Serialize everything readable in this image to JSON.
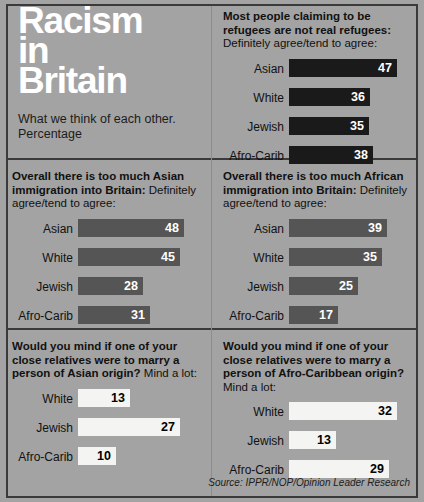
{
  "masthead": {
    "title_lines": [
      "Racism",
      "in",
      "Britain"
    ],
    "subtitle": "What we think of each other. Percentage"
  },
  "source": "Source: IPPR/NOP/Opinion Leader Research",
  "colors": {
    "background": "#a3a3a3",
    "frame": "#3a3a3a",
    "bar_dark": "#1a1a1a",
    "bar_gray": "#555555",
    "bar_white": "#f4f4f2",
    "shadow": "#1d1d1d",
    "title_text": "#ffffff",
    "body_text": "#111111"
  },
  "panels": [
    {
      "id": "refugees",
      "question": "Most people claiming to be refugees are not real refugees:",
      "subquestion": "Definitely agree/tend to agree:",
      "style": "dark",
      "bars": [
        {
          "label": "Asian",
          "value": "47",
          "px": 108
        },
        {
          "label": "White",
          "value": "36",
          "px": 81
        },
        {
          "label": "Jewish",
          "value": "35",
          "px": 80
        },
        {
          "label": "Afro-Carib",
          "value": "38",
          "px": 84
        }
      ]
    },
    {
      "id": "asian-immigration",
      "question": "Overall there is too much Asian immigration into Britain:",
      "subquestion": "Definitely agree/tend to agree:",
      "style": "gray",
      "bars": [
        {
          "label": "Asian",
          "value": "48",
          "px": 106
        },
        {
          "label": "White",
          "value": "45",
          "px": 102
        },
        {
          "label": "Jewish",
          "value": "28",
          "px": 65
        },
        {
          "label": "Afro-Carib",
          "value": "31",
          "px": 72
        }
      ]
    },
    {
      "id": "african-immigration",
      "question": "Overall there is too much African immigration into Britain:",
      "subquestion": "Definitely agree/tend to agree:",
      "style": "gray",
      "bars": [
        {
          "label": "Asian",
          "value": "39",
          "px": 98
        },
        {
          "label": "White",
          "value": "35",
          "px": 93
        },
        {
          "label": "Jewish",
          "value": "25",
          "px": 69
        },
        {
          "label": "Afro-Carib",
          "value": "17",
          "px": 49
        }
      ]
    },
    {
      "id": "marry-asian",
      "question": "Would you mind if one of your close relatives were to marry a person of Asian origin?",
      "subquestion": "Mind a lot:",
      "style": "white",
      "bars": [
        {
          "label": "White",
          "value": "13",
          "px": 52
        },
        {
          "label": "Jewish",
          "value": "27",
          "px": 102
        },
        {
          "label": "Afro-Carib",
          "value": "10",
          "px": 38
        }
      ]
    },
    {
      "id": "marry-afro-caribbean",
      "question": "Would you mind if one of your close relatives were to marry a person of Afro-Caribbean origin?",
      "subquestion": "Mind a lot:",
      "style": "white",
      "bars": [
        {
          "label": "White",
          "value": "32",
          "px": 108
        },
        {
          "label": "Jewish",
          "value": "13",
          "px": 47
        },
        {
          "label": "Afro-Carib",
          "value": "29",
          "px": 100
        }
      ]
    }
  ],
  "chart_data": [
    {
      "type": "bar",
      "title": "Most people claiming to be refugees are not real refugees: Definitely agree/tend to agree:",
      "categories": [
        "Asian",
        "White",
        "Jewish",
        "Afro-Carib"
      ],
      "values": [
        47,
        36,
        35,
        38
      ],
      "xlabel": "",
      "ylabel": "Percentage",
      "ylim": [
        0,
        50
      ],
      "orientation": "horizontal",
      "grid": false,
      "legend": "none"
    },
    {
      "type": "bar",
      "title": "Overall there is too much Asian immigration into Britain: Definitely agree/tend to agree:",
      "categories": [
        "Asian",
        "White",
        "Jewish",
        "Afro-Carib"
      ],
      "values": [
        48,
        45,
        28,
        31
      ],
      "xlabel": "",
      "ylabel": "Percentage",
      "ylim": [
        0,
        50
      ],
      "orientation": "horizontal",
      "grid": false,
      "legend": "none"
    },
    {
      "type": "bar",
      "title": "Overall there is too much African immigration into Britain: Definitely agree/tend to agree:",
      "categories": [
        "Asian",
        "White",
        "Jewish",
        "Afro-Carib"
      ],
      "values": [
        39,
        35,
        25,
        17
      ],
      "xlabel": "",
      "ylabel": "Percentage",
      "ylim": [
        0,
        50
      ],
      "orientation": "horizontal",
      "grid": false,
      "legend": "none"
    },
    {
      "type": "bar",
      "title": "Would you mind if one of your close relatives were to marry a person of Asian origin? Mind a lot:",
      "categories": [
        "White",
        "Jewish",
        "Afro-Carib"
      ],
      "values": [
        13,
        27,
        10
      ],
      "xlabel": "",
      "ylabel": "Percentage",
      "ylim": [
        0,
        30
      ],
      "orientation": "horizontal",
      "grid": false,
      "legend": "none"
    },
    {
      "type": "bar",
      "title": "Would you mind if one of your close relatives were to marry a person of Afro-Caribbean origin? Mind a lot:",
      "categories": [
        "White",
        "Jewish",
        "Afro-Carib"
      ],
      "values": [
        32,
        13,
        29
      ],
      "xlabel": "",
      "ylabel": "Percentage",
      "ylim": [
        0,
        35
      ],
      "orientation": "horizontal",
      "grid": false,
      "legend": "none"
    }
  ]
}
